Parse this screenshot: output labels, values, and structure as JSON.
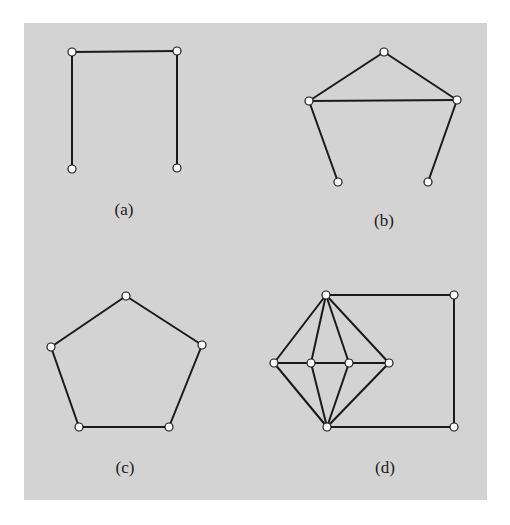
{
  "figure": {
    "background_color": "#d3d3d3",
    "edge_color": "#1a1a1a",
    "node_fill": "#ffffff",
    "node_radius": 4
  },
  "graphs": [
    {
      "id": "a",
      "label": "(a)",
      "label_pos": [
        124,
        210
      ],
      "nodes": [
        [
          72,
          52
        ],
        [
          177,
          51
        ],
        [
          72,
          169
        ],
        [
          177,
          168
        ]
      ],
      "edges": [
        [
          0,
          1
        ],
        [
          0,
          2
        ],
        [
          1,
          3
        ]
      ]
    },
    {
      "id": "b",
      "label": "(b)",
      "label_pos": [
        384,
        221
      ],
      "nodes": [
        [
          384,
          52
        ],
        [
          309,
          101
        ],
        [
          457,
          100
        ],
        [
          338,
          182
        ],
        [
          428,
          182
        ]
      ],
      "edges": [
        [
          0,
          1
        ],
        [
          0,
          2
        ],
        [
          1,
          2
        ],
        [
          1,
          3
        ],
        [
          2,
          4
        ]
      ]
    },
    {
      "id": "c",
      "label": "(c)",
      "label_pos": [
        125,
        468
      ],
      "nodes": [
        [
          126,
          296
        ],
        [
          51,
          347
        ],
        [
          202,
          345
        ],
        [
          79,
          427
        ],
        [
          169,
          427
        ]
      ],
      "edges": [
        [
          0,
          1
        ],
        [
          0,
          2
        ],
        [
          1,
          3
        ],
        [
          2,
          4
        ],
        [
          3,
          4
        ]
      ]
    },
    {
      "id": "d",
      "label": "(d)",
      "label_pos": [
        385,
        468
      ],
      "nodes": [
        [
          326,
          295
        ],
        [
          454,
          295
        ],
        [
          274,
          363
        ],
        [
          311,
          363
        ],
        [
          349,
          363
        ],
        [
          389,
          363
        ],
        [
          327,
          427
        ],
        [
          454,
          427
        ]
      ],
      "edges": [
        [
          0,
          1
        ],
        [
          1,
          7
        ],
        [
          6,
          7
        ],
        [
          0,
          2
        ],
        [
          0,
          3
        ],
        [
          0,
          4
        ],
        [
          0,
          5
        ],
        [
          6,
          2
        ],
        [
          6,
          3
        ],
        [
          6,
          4
        ],
        [
          6,
          5
        ],
        [
          2,
          3
        ],
        [
          3,
          4
        ],
        [
          4,
          5
        ]
      ]
    }
  ]
}
